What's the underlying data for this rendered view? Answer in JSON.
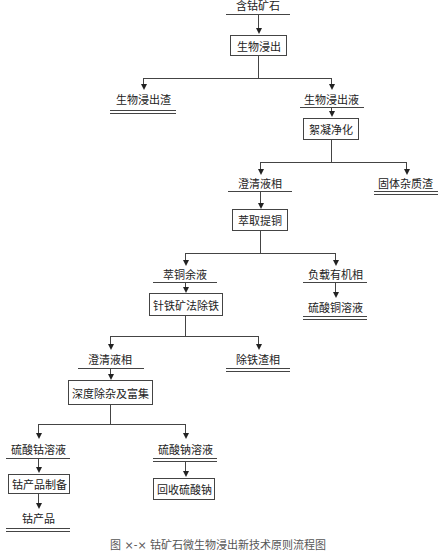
{
  "diagram": {
    "type": "process-flowchart",
    "nodes": {
      "ore": "含钴矿石",
      "bioleach": "生物浸出",
      "bioleach_residue": "生物浸出渣",
      "bioleach_liquor": "生物浸出液",
      "flocculation": "絮凝净化",
      "clear_phase_1": "澄清液相",
      "solid_residue": "固体杂质渣",
      "cu_extraction": "萃取提铜",
      "raffinate": "萃铜余液",
      "loaded_organic": "负载有机相",
      "goethite_fe_removal": "针铁矿法除铁",
      "cuso4_solution": "硫酸铜溶液",
      "clear_phase_2": "澄清液相",
      "fe_residue": "除铁渣相",
      "deep_purification": "深度除杂及富集",
      "coso4_solution": "硫酸钴溶液",
      "na2so4_solution": "硫酸钠溶液",
      "co_product_prep": "钴产品制备",
      "na2so4_recovery": "回收硫酸钠",
      "co_product": "钴产品"
    },
    "edges": [
      [
        "ore",
        "bioleach"
      ],
      [
        "bioleach",
        "bioleach_residue"
      ],
      [
        "bioleach",
        "bioleach_liquor"
      ],
      [
        "bioleach_liquor",
        "flocculation"
      ],
      [
        "flocculation",
        "clear_phase_1"
      ],
      [
        "flocculation",
        "solid_residue"
      ],
      [
        "clear_phase_1",
        "cu_extraction"
      ],
      [
        "cu_extraction",
        "raffinate"
      ],
      [
        "cu_extraction",
        "loaded_organic"
      ],
      [
        "raffinate",
        "goethite_fe_removal"
      ],
      [
        "loaded_organic",
        "cuso4_solution"
      ],
      [
        "goethite_fe_removal",
        "clear_phase_2"
      ],
      [
        "goethite_fe_removal",
        "fe_residue"
      ],
      [
        "clear_phase_2",
        "deep_purification"
      ],
      [
        "deep_purification",
        "coso4_solution"
      ],
      [
        "deep_purification",
        "na2so4_solution"
      ],
      [
        "coso4_solution",
        "co_product_prep"
      ],
      [
        "na2so4_solution",
        "na2so4_recovery"
      ],
      [
        "co_product_prep",
        "co_product"
      ]
    ],
    "caption": "图 ×-× 钴矿石微生物浸出新技术原则流程图"
  }
}
